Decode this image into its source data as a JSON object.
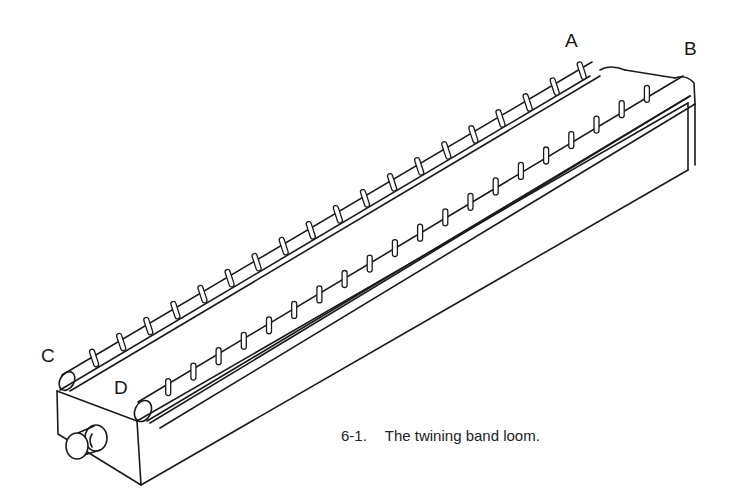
{
  "figure": {
    "labels": {
      "a": "A",
      "b": "B",
      "c": "C",
      "d": "D"
    },
    "caption": {
      "number": "6-1.",
      "text": "The twining band loom."
    },
    "colors": {
      "ink": "#1a1a1a",
      "background": "#ffffff"
    },
    "back_roller": {
      "start": [
        67,
        381
      ],
      "end": [
        598,
        68
      ],
      "peg_count": 19,
      "peg_style": "slanted"
    },
    "front_roller": {
      "start": [
        143,
        410
      ],
      "end": [
        662,
        92
      ],
      "peg_count": 20,
      "peg_style": "upright"
    }
  }
}
